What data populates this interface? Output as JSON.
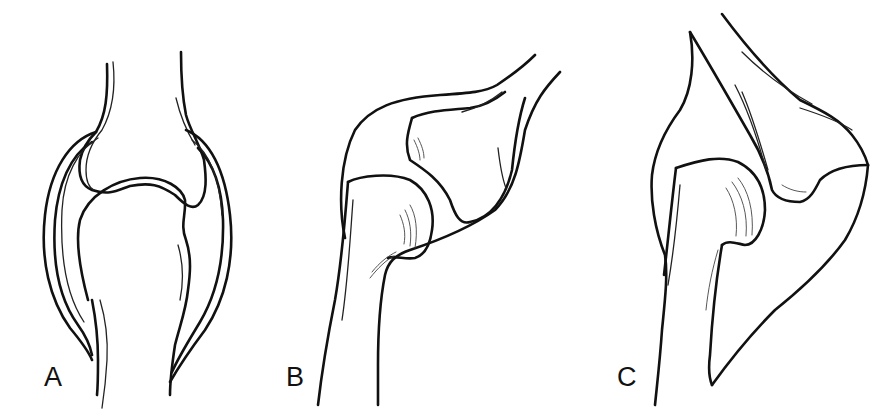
{
  "figure": {
    "panels": [
      {
        "id": "A",
        "label": "A",
        "description": "Joint with synovial capsule surrounding two opposed bone ends"
      },
      {
        "id": "B",
        "label": "B",
        "description": "Angled joint with capsule enclosing bone head and socket"
      },
      {
        "id": "C",
        "label": "C",
        "description": "Angled joint with bone head articulating under a larger bone"
      }
    ],
    "colors": {
      "background": "#ffffff",
      "line": "#111111"
    }
  }
}
